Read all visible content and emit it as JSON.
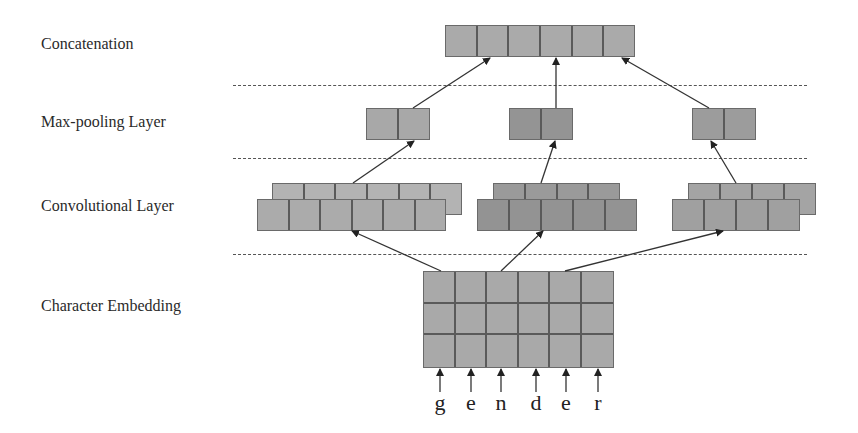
{
  "layers": {
    "concatenation": "Concatenation",
    "max_pooling": "Max-pooling Layer",
    "convolutional": "Convolutional  Layer",
    "embedding": "Character Embedding"
  },
  "input_characters": [
    "g",
    "e",
    "n",
    "d",
    "e",
    "r"
  ],
  "chars": {
    "c0": "g",
    "c1": "e",
    "c2": "n",
    "c3": "d",
    "c4": "e",
    "c5": "r"
  },
  "structure": {
    "concatenation_cells": 6,
    "max_pooling_groups": [
      {
        "cells": 2,
        "color": "#a8a8a8"
      },
      {
        "cells": 2,
        "color": "#949494"
      },
      {
        "cells": 2,
        "color": "#9c9c9c"
      }
    ],
    "conv_groups": [
      {
        "filter_maps": 2,
        "cells_back": 6,
        "cells_front": 6,
        "color": "#ababab"
      },
      {
        "filter_maps": 2,
        "cells_back": 4,
        "cells_front": 5,
        "color": "#939393"
      },
      {
        "filter_maps": 2,
        "cells_back": 4,
        "cells_front": 4,
        "color": "#a0a0a0"
      }
    ],
    "embedding_grid": {
      "rows": 3,
      "cols": 6
    }
  },
  "colors": {
    "cell_light": "#b0b0b0",
    "cell_mid": "#a4a4a4",
    "cell_dark": "#949494",
    "cell_border": "#5a5a5a",
    "dotted_line": "#555555",
    "arrow": "#222222"
  }
}
